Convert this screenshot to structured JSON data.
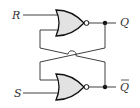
{
  "diagram": {
    "type": "SR latch (cross-coupled NOR gates)",
    "inputs": [
      {
        "label": "R",
        "y": 15
      },
      {
        "label": "S",
        "y": 93
      }
    ],
    "outputs": [
      {
        "label": "Q",
        "bar": false,
        "y": 22
      },
      {
        "label": "Q",
        "bar": true,
        "y": 87
      }
    ],
    "gates": [
      {
        "kind": "NOR",
        "position": "top"
      },
      {
        "kind": "NOR",
        "position": "bottom"
      }
    ],
    "colors": {
      "gate_fill": "#e2e2e2",
      "stroke": "#111111",
      "text": "#333333",
      "background": "#ffffff"
    }
  }
}
